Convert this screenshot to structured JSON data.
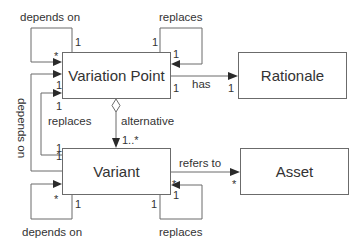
{
  "diagram": {
    "type": "UML class diagram",
    "classes": {
      "variation_point": {
        "label": "Variation Point"
      },
      "rationale": {
        "label": "Rationale"
      },
      "variant": {
        "label": "Variant"
      },
      "asset": {
        "label": "Asset"
      }
    },
    "relations": {
      "vp_depends_on": {
        "label": "depends on",
        "mult_source": "1",
        "mult_target": "*"
      },
      "vp_replaces": {
        "label": "replaces",
        "mult_source": "1",
        "mult_target": "1"
      },
      "vp_has_rationale": {
        "label": "has",
        "mult_source": "1",
        "mult_target": "1"
      },
      "vp_alternative": {
        "label": "alternative",
        "mult_target": "1..*"
      },
      "variant_replaces_vp": {
        "label": "replaces",
        "mult_source": "1",
        "mult_target": "1"
      },
      "variant_depends_on_vp": {
        "label": "depends on",
        "mult_source": "1",
        "mult_target": "1"
      },
      "variant_depends_on": {
        "label": "depends on",
        "mult_source": "1",
        "mult_target": "*"
      },
      "variant_replaces": {
        "label": "replaces",
        "mult_source": "1",
        "mult_target": "1"
      },
      "variant_refers_to_asset": {
        "label": "refers to",
        "mult_source": "*",
        "mult_target": "*"
      }
    }
  }
}
